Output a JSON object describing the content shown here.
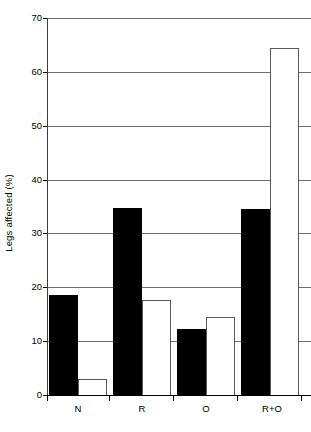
{
  "chart_data": {
    "type": "bar",
    "title": "",
    "xlabel": "",
    "ylabel": "Legs affected (%)",
    "categories": [
      "N",
      "R",
      "O",
      "R+O"
    ],
    "series": [
      {
        "name": "black",
        "values": [
          18.5,
          34.8,
          12.2,
          34.6
        ]
      },
      {
        "name": "white",
        "values": [
          3.0,
          17.6,
          14.5,
          64.5
        ]
      }
    ],
    "ylim": [
      0,
      70
    ],
    "yticks": [
      0,
      10,
      20,
      30,
      40,
      50,
      60,
      70
    ],
    "ytick_labels": [
      "0",
      "10",
      "20",
      "30",
      "40",
      "50",
      "60",
      "70"
    ],
    "grid": true,
    "legend": "none"
  },
  "axis": {
    "y_title": "Legs affected (%)"
  },
  "colors": {
    "filled_bar": "#000000",
    "open_bar_fill": "#ffffff",
    "open_bar_stroke": "#5a5a5a",
    "gridline": "#6f6f6f",
    "axis": "#000000",
    "background": "#ffffff"
  }
}
